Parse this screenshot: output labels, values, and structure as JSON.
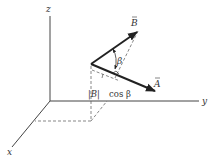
{
  "diagram": {
    "axes": {
      "z_label": "z",
      "y_label": "y",
      "x_label": "x"
    },
    "vectors": {
      "A_label": "A",
      "B_label": "B"
    },
    "angle_label": "β",
    "projection_label": {
      "magnitude": "|B|",
      "trig": "cos β"
    },
    "colors": {
      "ink": "#333333",
      "background": "#ffffff"
    }
  }
}
